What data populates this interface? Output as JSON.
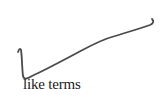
{
  "annotation": {
    "type": "handwritten-check-stroke",
    "stroke_color": "#4a4a4a"
  },
  "caption": {
    "text": "like terms"
  }
}
